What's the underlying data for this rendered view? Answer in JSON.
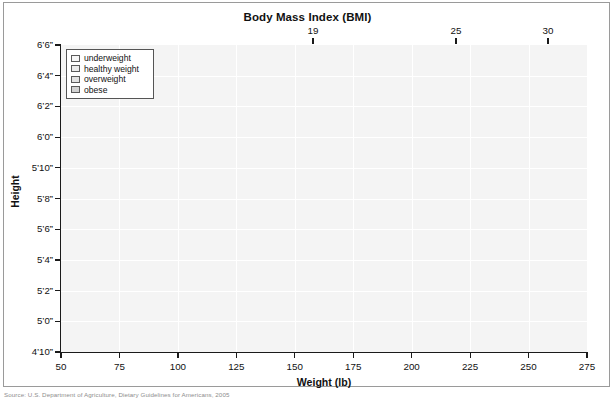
{
  "chart_data": {
    "type": "area",
    "title": "Body Mass Index (BMI)",
    "xlabel": "Weight (lb)",
    "ylabel": "Height",
    "xlim": [
      50,
      275
    ],
    "ylim_inches": [
      58,
      78
    ],
    "grid": true,
    "legend_position": "top-left-inside",
    "x_ticks": [
      {
        "value": 50,
        "label": "50"
      },
      {
        "value": 75,
        "label": "75"
      },
      {
        "value": 100,
        "label": "100"
      },
      {
        "value": 125,
        "label": "125"
      },
      {
        "value": 150,
        "label": "150"
      },
      {
        "value": 175,
        "label": "175"
      },
      {
        "value": 200,
        "label": "200"
      },
      {
        "value": 225,
        "label": "225"
      },
      {
        "value": 250,
        "label": "250"
      },
      {
        "value": 275,
        "label": "275"
      }
    ],
    "y_ticks": [
      {
        "inches": 78,
        "label": "6’6”"
      },
      {
        "inches": 76,
        "label": "6’4”"
      },
      {
        "inches": 74,
        "label": "6’2”"
      },
      {
        "inches": 72,
        "label": "6’0”"
      },
      {
        "inches": 70,
        "label": "5’10”"
      },
      {
        "inches": 68,
        "label": "5’8”"
      },
      {
        "inches": 66,
        "label": "5’6”"
      },
      {
        "inches": 64,
        "label": "5’4”"
      },
      {
        "inches": 62,
        "label": "5’2”"
      },
      {
        "inches": 60,
        "label": "5’0”"
      },
      {
        "inches": 58,
        "label": "4’10”"
      }
    ],
    "top_axis": {
      "name": "BMI contour labels",
      "ticks": [
        {
          "bmi": 19,
          "label": "19",
          "x_px": 313
        },
        {
          "bmi": 25,
          "label": "25",
          "x_px": 456
        },
        {
          "bmi": 30,
          "label": "30",
          "x_px": 548
        }
      ]
    },
    "series": [
      {
        "name": "underweight",
        "bmi_range": [
          0,
          19
        ],
        "color": "#f4f4f4"
      },
      {
        "name": "healthy weight",
        "bmi_range": [
          19,
          25
        ],
        "color": "#ededed"
      },
      {
        "name": "overweight",
        "bmi_range": [
          25,
          30
        ],
        "color": "#e2e2e2"
      },
      {
        "name": "obese",
        "bmi_range": [
          30,
          100
        ],
        "color": "#d6d6d6"
      }
    ]
  },
  "chart": {
    "title": "Body Mass Index (BMI)",
    "x_axis_title": "Weight (lb)",
    "y_axis_title": "Height"
  },
  "legend": {
    "items": [
      {
        "label": "underweight",
        "color": "#f6f6f6"
      },
      {
        "label": "healthy weight",
        "color": "#ececec"
      },
      {
        "label": "overweight",
        "color": "#e2e2e2"
      },
      {
        "label": "obese",
        "color": "#d2d2d2"
      }
    ]
  },
  "source": {
    "note": "Source: U.S. Department of Agriculture, Dietary Guidelines for Americans, 2005"
  }
}
